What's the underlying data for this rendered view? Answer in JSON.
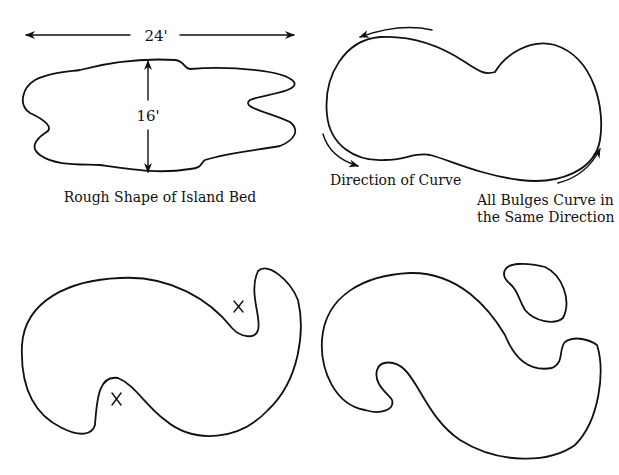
{
  "panels": {
    "rough_shape": {
      "width_label": "24'",
      "height_label": "16'",
      "caption": "Rough Shape of Island Bed"
    },
    "curve_direction": {
      "left_caption": "Direction of Curve",
      "right_caption_line1": "All Bulges Curve in",
      "right_caption_line2": "the Same Direction"
    },
    "bottom_left": {
      "markers": [
        "X",
        "X"
      ]
    },
    "bottom_right": {}
  }
}
